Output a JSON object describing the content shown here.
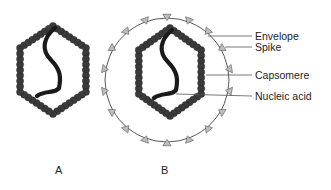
{
  "figure": {
    "panels": [
      {
        "id": "A",
        "label": "A",
        "description": "naked virus"
      },
      {
        "id": "B",
        "label": "B",
        "description": "enveloped virus"
      }
    ],
    "labels": {
      "envelope": "Envelope",
      "spike": "Spike",
      "capsomere": "Capsomere",
      "nucleic_acid": "Nucleic acid"
    },
    "colors": {
      "capsomere": "#3a3a3a",
      "nucleic_acid": "#1a1a1a",
      "envelope": "#444444",
      "spike_fill": "#bdbdbd",
      "leader_line": "#555555"
    }
  }
}
